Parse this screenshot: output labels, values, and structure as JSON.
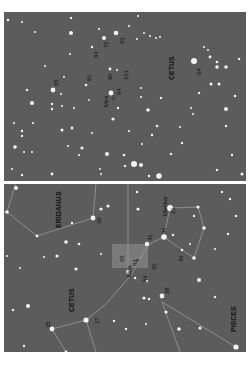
{
  "top_chart": {
    "constellation": "CETUS",
    "target": {
      "name": "Mira",
      "designation": "o"
    },
    "comparison_labels": [
      "63",
      "72",
      "84",
      "81",
      "90",
      "101",
      "94",
      "65",
      "54"
    ],
    "background_color": "#5c5c5c",
    "star_color": "#f4f4f4"
  },
  "bottom_chart": {
    "constellations": [
      "ERIDANUS",
      "CETUS",
      "PISCES"
    ],
    "named_stars": [
      {
        "name": "Menkar",
        "label": "25"
      },
      {
        "name": "Mira",
        "designation": "o"
      }
    ],
    "magnitude_labels": [
      "39",
      "35",
      "41",
      "49",
      "63",
      "60",
      "65",
      "54",
      "38",
      "37",
      "35"
    ],
    "highlight_box_color": "#7a7a7a"
  },
  "separator_color": "#ffffff"
}
